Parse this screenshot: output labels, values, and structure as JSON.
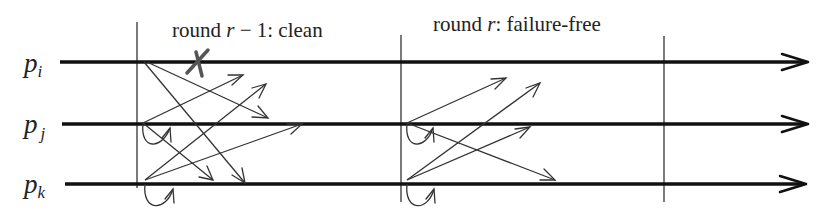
{
  "diagram": {
    "type": "space-time message diagram",
    "processes": [
      {
        "id": "pi",
        "label_base": "p",
        "label_sub": "i",
        "y": 62
      },
      {
        "id": "pj",
        "label_base": "p",
        "label_sub": "j",
        "y": 124
      },
      {
        "id": "pk",
        "label_base": "p",
        "label_sub": "k",
        "y": 184
      }
    ],
    "rounds": [
      {
        "label_prefix": "round ",
        "label_var": "r",
        "label_suffix": " − 1: clean",
        "x_start": 137,
        "x_end": 401
      },
      {
        "label_prefix": "round ",
        "label_var": "r",
        "label_suffix": ": failure-free",
        "x_start": 401,
        "x_end": 664
      }
    ],
    "round_boundaries_x": [
      137,
      401,
      664
    ],
    "crash_marker": {
      "process": "pi",
      "symbol": "X",
      "x": 198,
      "y": 62
    },
    "messages": {
      "round_r_minus_1": [
        {
          "from": "pi",
          "to": "pj",
          "x1": 147,
          "y1": 62,
          "x2": 268,
          "y2": 118
        },
        {
          "from": "pi",
          "to": "pk",
          "x1": 145,
          "y1": 62,
          "x2": 245,
          "y2": 182
        },
        {
          "from": "pj",
          "to": "pi",
          "x1": 143,
          "y1": 123,
          "x2": 243,
          "y2": 75
        },
        {
          "from": "pj",
          "to": "pk",
          "x1": 143,
          "y1": 123,
          "x2": 213,
          "y2": 180
        },
        {
          "from": "pj",
          "to": "pj",
          "self_loop": true,
          "x": 143,
          "y": 123
        },
        {
          "from": "pk",
          "to": "pi",
          "x1": 145,
          "y1": 180,
          "x2": 266,
          "y2": 84
        },
        {
          "from": "pk",
          "to": "pj",
          "x1": 145,
          "y1": 180,
          "x2": 302,
          "y2": 124
        },
        {
          "from": "pk",
          "to": "pk",
          "self_loop": true,
          "x": 145,
          "y": 180
        }
      ],
      "round_r": [
        {
          "from": "pj",
          "to": "pi",
          "x1": 407,
          "y1": 123,
          "x2": 506,
          "y2": 78
        },
        {
          "from": "pj",
          "to": "pk",
          "x1": 407,
          "y1": 123,
          "x2": 555,
          "y2": 180
        },
        {
          "from": "pj",
          "to": "pj",
          "self_loop": true,
          "x": 407,
          "y": 123
        },
        {
          "from": "pk",
          "to": "pi",
          "x1": 407,
          "y1": 180,
          "x2": 540,
          "y2": 83
        },
        {
          "from": "pk",
          "to": "pj",
          "x1": 407,
          "y1": 180,
          "x2": 530,
          "y2": 127
        },
        {
          "from": "pk",
          "to": "pk",
          "self_loop": true,
          "x": 407,
          "y": 180
        }
      ]
    },
    "colors": {
      "process_line": "#111111",
      "message": "#333333",
      "crash": "#555555",
      "background": "#ffffff"
    }
  }
}
